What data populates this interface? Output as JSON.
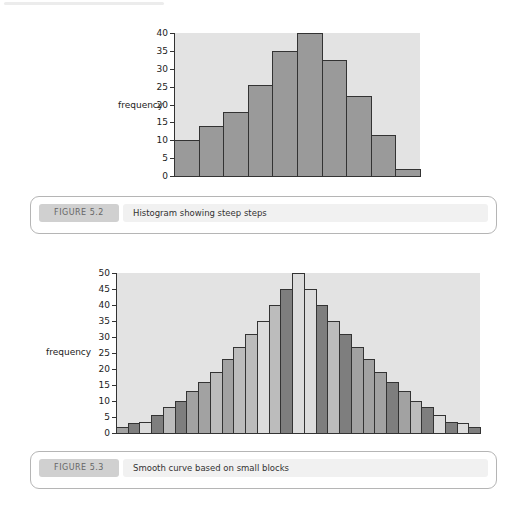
{
  "figures": [
    {
      "id": "fig52",
      "caption_label": "FIGURE 5.2",
      "caption_text": "Histogram showing steep steps"
    },
    {
      "id": "fig53",
      "caption_label": "FIGURE 5.3",
      "caption_text": "Smooth curve based on small blocks"
    }
  ],
  "chart_data": [
    {
      "type": "bar",
      "title": "",
      "xlabel": "",
      "ylabel": "frequency",
      "ylim": [
        0,
        40
      ],
      "yticks": [
        0,
        5,
        10,
        15,
        20,
        25,
        30,
        35,
        40
      ],
      "categories": [
        "1",
        "2",
        "3",
        "4",
        "5",
        "6",
        "7",
        "8",
        "9",
        "10"
      ],
      "values": [
        10,
        14,
        18,
        25.5,
        35,
        40,
        32.5,
        22.5,
        11.5,
        2
      ],
      "bar_color": "#9a9a9a",
      "background": "#e3e3e3",
      "grid": false
    },
    {
      "type": "bar",
      "title": "",
      "xlabel": "",
      "ylabel": "frequency",
      "ylim": [
        0,
        50
      ],
      "yticks": [
        0,
        5,
        10,
        15,
        20,
        25,
        30,
        35,
        40,
        45,
        50
      ],
      "categories": [
        "1",
        "2",
        "3",
        "4",
        "5",
        "6",
        "7",
        "8",
        "9",
        "10",
        "11",
        "12",
        "13",
        "14",
        "15",
        "16",
        "17",
        "18",
        "19",
        "20",
        "21",
        "22",
        "23",
        "24",
        "25",
        "26",
        "27",
        "28",
        "29",
        "30",
        "31"
      ],
      "values": [
        2,
        3,
        3.5,
        5.5,
        8,
        10,
        13,
        16,
        19,
        23,
        27,
        31,
        35,
        40,
        45,
        50,
        45,
        40,
        35,
        31,
        27,
        23,
        19,
        16,
        13,
        10,
        8,
        5.5,
        3.5,
        3,
        2
      ],
      "bar_shades": [
        "m",
        "d",
        "l",
        "d",
        "s",
        "d",
        "m",
        "m",
        "s",
        "m",
        "s",
        "s",
        "l",
        "s",
        "d",
        "l",
        "l",
        "d",
        "s",
        "d",
        "m",
        "m",
        "m",
        "d",
        "m",
        "s",
        "d",
        "l",
        "d",
        "l",
        "d"
      ],
      "shade_colors": {
        "l": "#dcdcdc",
        "s": "#bcbcbc",
        "m": "#a2a2a2",
        "d": "#7e7e7e"
      },
      "background": "#e3e3e3",
      "grid": false
    }
  ]
}
